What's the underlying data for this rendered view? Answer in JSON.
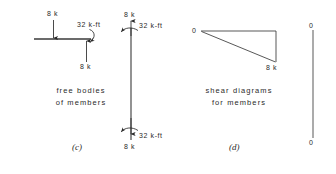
{
  "figure": {
    "panels": [
      {
        "id": "c",
        "label": "(c)",
        "caption_line1": "free bodies",
        "caption_line2": "of members",
        "members": [
          {
            "name": "horizontal-member",
            "forces": [
              {
                "label": "8 k",
                "direction": "down",
                "position": "top-mid"
              },
              {
                "label": "8 k",
                "direction": "up",
                "position": "right-end-below"
              }
            ],
            "moments": [
              {
                "label": "32 k-ft",
                "sense": "clockwise",
                "position": "right-end"
              }
            ]
          },
          {
            "name": "vertical-member",
            "forces": [
              {
                "label": "8 k",
                "direction": "up",
                "position": "top"
              },
              {
                "label": "8 k",
                "direction": "down",
                "position": "bottom"
              }
            ],
            "moments": [
              {
                "label": "32 k-ft",
                "sense": "counterclockwise",
                "position": "top"
              },
              {
                "label": "32 k-ft",
                "sense": "counterclockwise",
                "position": "bottom"
              }
            ]
          }
        ]
      },
      {
        "id": "d",
        "label": "(d)",
        "caption_line1": "shear  diagrams",
        "caption_line2": "for members",
        "diagrams": [
          {
            "name": "horizontal-member-shear",
            "type": "triangular",
            "left_value": "0",
            "right_value": "8 k"
          },
          {
            "name": "vertical-member-shear",
            "type": "zero",
            "top_value": "0",
            "bottom_value": "0"
          }
        ]
      }
    ]
  },
  "colors": {
    "ink": "#2b2b2b",
    "line": "#3a3a3a",
    "background": "#ffffff"
  }
}
